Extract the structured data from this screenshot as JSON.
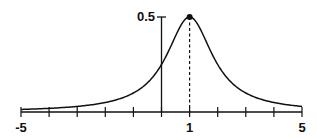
{
  "chart_data": {
    "type": "line",
    "title": "",
    "xlabel": "",
    "ylabel": "",
    "function": "f(x) = 0.5 / (1 + (x - 1)^2)",
    "xlim": [
      -5,
      5
    ],
    "ylim": [
      0,
      0.5
    ],
    "grid": false,
    "legend": null,
    "x_ticks": [
      -5,
      -4,
      -3,
      -2,
      -1,
      0,
      1,
      2,
      3,
      4,
      5
    ],
    "x_tick_labels": [
      {
        "value": -5,
        "label": "-5"
      },
      {
        "value": 1,
        "label": "1"
      },
      {
        "value": 5,
        "label": "5"
      }
    ],
    "y_tick_labels": [
      {
        "value": 0.5,
        "label": "0.5"
      }
    ],
    "series": [
      {
        "name": "curve",
        "x": [
          -5,
          -4,
          -3,
          -2,
          -1,
          0,
          0.5,
          1,
          1.5,
          2,
          3,
          4,
          5
        ],
        "y": [
          0.0135,
          0.0192,
          0.0294,
          0.05,
          0.1,
          0.25,
          0.4,
          0.5,
          0.4,
          0.25,
          0.1,
          0.05,
          0.0294
        ]
      }
    ],
    "annotations": [
      {
        "type": "point",
        "x": 1,
        "y": 0.5,
        "label": "peak"
      },
      {
        "type": "dashed-vline",
        "x": 1,
        "from": 0,
        "to": 0.5
      }
    ]
  },
  "labels": {
    "y_top": "0.5",
    "x_left": "-5",
    "x_mid": "1",
    "x_right": "5"
  },
  "colors": {
    "ink": "#111111",
    "background": "#ffffff"
  }
}
